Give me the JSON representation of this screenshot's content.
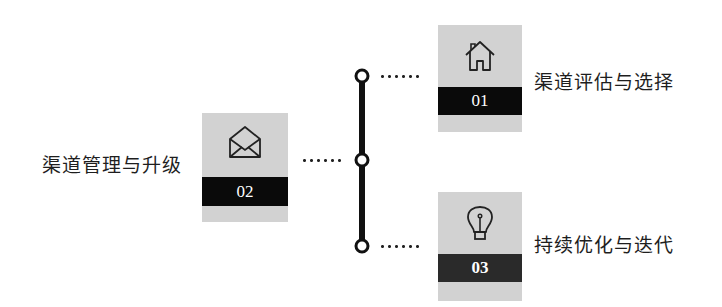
{
  "diagram": {
    "steps": [
      {
        "number": "01",
        "label": "渠道评估与选择",
        "icon": "house-icon",
        "band_color": "#0a0a0a"
      },
      {
        "number": "02",
        "label": "渠道管理与升级",
        "icon": "envelope-icon",
        "band_color": "#0a0a0a"
      },
      {
        "number": "03",
        "label": "持续优化与迭代",
        "icon": "lightbulb-icon",
        "band_color": "#2a2a2a"
      }
    ],
    "colors": {
      "box_bg": "#d2d2d2",
      "line": "#111111"
    }
  }
}
